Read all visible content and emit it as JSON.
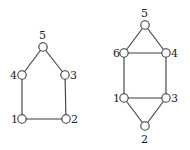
{
  "diagram": {
    "colors": {
      "stroke": "#3a3a3a",
      "label": "#222222",
      "background": "#ffffff"
    },
    "graphs": [
      {
        "name": "left-graph",
        "nodes": [
          {
            "id": "1",
            "label": "1",
            "x": 22,
            "y": 119,
            "lx": 11,
            "ly": 123
          },
          {
            "id": "2",
            "label": "2",
            "x": 66,
            "y": 119,
            "lx": 71,
            "ly": 123
          },
          {
            "id": "3",
            "label": "3",
            "x": 65,
            "y": 75,
            "lx": 70,
            "ly": 79
          },
          {
            "id": "4",
            "label": "4",
            "x": 22,
            "y": 75,
            "lx": 10,
            "ly": 79
          },
          {
            "id": "5",
            "label": "5",
            "x": 43,
            "y": 47,
            "lx": 39,
            "ly": 39
          }
        ],
        "edges": [
          [
            "1",
            "2"
          ],
          [
            "1",
            "4"
          ],
          [
            "2",
            "3"
          ],
          [
            "3",
            "5"
          ],
          [
            "4",
            "5"
          ]
        ]
      },
      {
        "name": "right-graph",
        "nodes": [
          {
            "id": "1",
            "label": "1",
            "x": 124,
            "y": 98,
            "lx": 113,
            "ly": 102
          },
          {
            "id": "2",
            "label": "2",
            "x": 145,
            "y": 126,
            "lx": 141,
            "ly": 143
          },
          {
            "id": "3",
            "label": "3",
            "x": 166,
            "y": 98,
            "lx": 171,
            "ly": 102
          },
          {
            "id": "4",
            "label": "4",
            "x": 166,
            "y": 53,
            "lx": 171,
            "ly": 57
          },
          {
            "id": "5",
            "label": "5",
            "x": 145,
            "y": 25,
            "lx": 141,
            "ly": 17
          },
          {
            "id": "6",
            "label": "6",
            "x": 124,
            "y": 53,
            "lx": 113,
            "ly": 57
          }
        ],
        "edges": [
          [
            "1",
            "2"
          ],
          [
            "1",
            "3"
          ],
          [
            "2",
            "3"
          ],
          [
            "1",
            "6"
          ],
          [
            "3",
            "4"
          ],
          [
            "6",
            "4"
          ],
          [
            "6",
            "5"
          ],
          [
            "4",
            "5"
          ]
        ]
      }
    ]
  }
}
